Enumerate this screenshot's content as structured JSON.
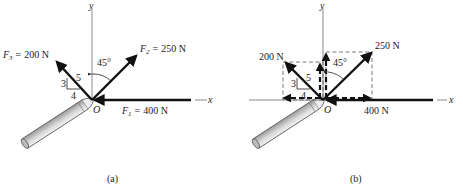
{
  "figure_a": {
    "caption": "(a)",
    "axis_x_label": "x",
    "axis_y_label": "y",
    "origin_label": "O",
    "forces": [
      {
        "symbol": "F",
        "subscript": "1",
        "eq": "=",
        "value": "400 N",
        "direction": "along -x"
      },
      {
        "symbol": "F",
        "subscript": "2",
        "eq": "=",
        "value": "250 N",
        "angle_from_y": "45°"
      },
      {
        "symbol": "F",
        "subscript": "3",
        "eq": "=",
        "value": "200 N",
        "slope": {
          "rise": "3",
          "run": "4",
          "hyp": "5"
        }
      }
    ],
    "angle_label": "45°",
    "triangle": {
      "rise": "3",
      "run": "4",
      "hyp": "5"
    }
  },
  "figure_b": {
    "caption": "(b)",
    "axis_x_label": "x",
    "axis_y_label": "y",
    "origin_label": "O",
    "f1_label": "400 N",
    "f2_label": "250 N",
    "f3_label": "200 N",
    "angle_label": "45°",
    "triangle": {
      "rise": "3",
      "run": "4",
      "hyp": "5"
    }
  }
}
